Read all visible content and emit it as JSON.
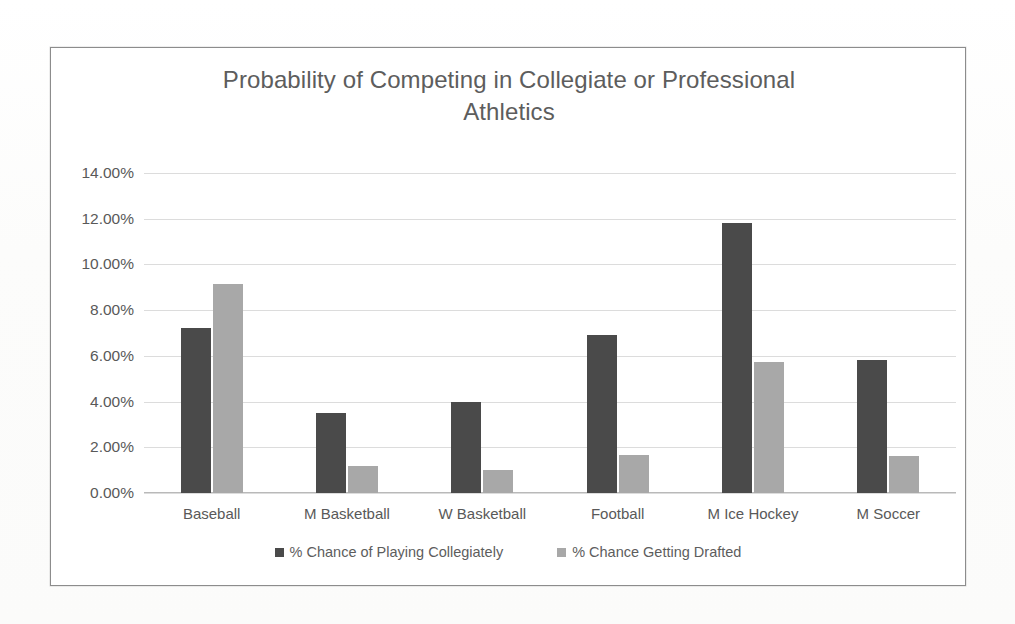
{
  "chart_data": {
    "type": "bar",
    "title": "Probability of Competing in Collegiate or Professional\nAthletics",
    "title_line1": "Probability of Competing in Collegiate or Professional",
    "title_line2": "Athletics",
    "xlabel": "",
    "ylabel": "",
    "ylim": [
      0,
      14
    ],
    "ytick_values": [
      14,
      12,
      10,
      8,
      6,
      4,
      2,
      0
    ],
    "ytick_labels": [
      "14.00%",
      "12.00%",
      "10.00%",
      "8.00%",
      "6.00%",
      "4.00%",
      "2.00%",
      "0.00%"
    ],
    "grid": true,
    "legend_position": "bottom",
    "categories": [
      "Baseball",
      "M Basketball",
      "W Basketball",
      "Football",
      "M Ice Hockey",
      "M Soccer"
    ],
    "series": [
      {
        "name": "% Chance of Playing Collegiately",
        "color": "#4a4a4a",
        "values": [
          7.2,
          3.5,
          4.0,
          6.9,
          11.8,
          5.8
        ]
      },
      {
        "name": "% Chance Getting Drafted",
        "color": "#a8a8a8",
        "values": [
          9.15,
          1.2,
          1.0,
          1.65,
          5.75,
          1.6
        ]
      }
    ]
  }
}
